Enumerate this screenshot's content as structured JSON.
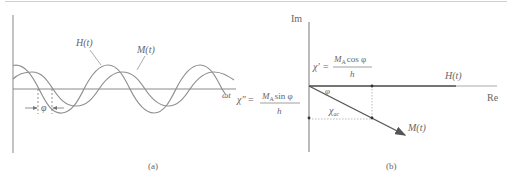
{
  "panel_a": {
    "caption": "(a)",
    "x_axis_label": "ωt",
    "curve_h_label": "H(t)",
    "curve_m_label": "M(t)",
    "phase_label": "φ"
  },
  "panel_b": {
    "caption": "(b)",
    "imag_axis_label": "Im",
    "real_axis_label": "Re",
    "vector_h_label": "H(t)",
    "vector_m_label": "M(t)",
    "angle_label": "φ",
    "magnitude_label_main": "χ",
    "magnitude_label_sub": "ac",
    "chi_prime": {
      "symbol": "χ′",
      "eq": "=",
      "numerator_m": "M",
      "numerator_sub": "A",
      "numerator_fn": "cos φ",
      "denominator": "h"
    },
    "chi_double_prime": {
      "symbol": "χ″",
      "eq": "=",
      "numerator_m": "M",
      "numerator_sub": "A",
      "numerator_fn": "sin φ",
      "denominator": "h"
    }
  },
  "colors": {
    "axis": "#6a6a6a",
    "curve": "#8a8a8a",
    "vector": "#444444",
    "dotted": "#9a9a9a",
    "text": "#666666"
  }
}
